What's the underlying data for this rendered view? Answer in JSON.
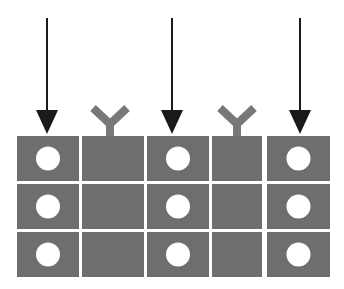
{
  "figure": {
    "title": "",
    "background_color": "#ffffff",
    "cell_fill_color": "#6e6e6e",
    "dot_fill_color": "#ffffff",
    "arrow_color": "#1a1a1a",
    "fork_color": "#787878"
  },
  "grid": {
    "columns": 5,
    "rows": 3,
    "column_x": [
      17,
      82,
      147,
      212,
      267
    ],
    "column_width": [
      62,
      62,
      62,
      50,
      63
    ],
    "row_y": [
      136,
      184,
      232
    ],
    "row_height": 45,
    "dot_radius": 12
  },
  "columns": [
    {
      "index": 1,
      "name": "column-1",
      "marker": "arrow",
      "marker_name": "down-arrow-icon",
      "marker_x": 47,
      "has_dots": true,
      "cells": [
        {
          "row": 1,
          "name": "cell-r1c1",
          "filled": true
        },
        {
          "row": 2,
          "name": "cell-r2c1",
          "filled": true
        },
        {
          "row": 3,
          "name": "cell-r3c1",
          "filled": true
        }
      ]
    },
    {
      "index": 2,
      "name": "column-2",
      "marker": "fork",
      "marker_name": "y-fork-icon",
      "marker_x": 110,
      "has_dots": false,
      "cells": [
        {
          "row": 1,
          "name": "cell-r1c2",
          "filled": false
        },
        {
          "row": 2,
          "name": "cell-r2c2",
          "filled": false
        },
        {
          "row": 3,
          "name": "cell-r3c2",
          "filled": false
        }
      ]
    },
    {
      "index": 3,
      "name": "column-3",
      "marker": "arrow",
      "marker_name": "down-arrow-icon",
      "marker_x": 172,
      "has_dots": true,
      "cells": [
        {
          "row": 1,
          "name": "cell-r1c3",
          "filled": true
        },
        {
          "row": 2,
          "name": "cell-r2c3",
          "filled": true
        },
        {
          "row": 3,
          "name": "cell-r3c3",
          "filled": true
        }
      ]
    },
    {
      "index": 4,
      "name": "column-4",
      "marker": "fork",
      "marker_name": "y-fork-icon",
      "marker_x": 237,
      "has_dots": false,
      "cells": [
        {
          "row": 1,
          "name": "cell-r1c4",
          "filled": false
        },
        {
          "row": 2,
          "name": "cell-r2c4",
          "filled": false
        },
        {
          "row": 3,
          "name": "cell-r3c4",
          "filled": false
        }
      ]
    },
    {
      "index": 5,
      "name": "column-5",
      "marker": "arrow",
      "marker_name": "down-arrow-icon",
      "marker_x": 300,
      "has_dots": true,
      "cells": [
        {
          "row": 1,
          "name": "cell-r1c5",
          "filled": true
        },
        {
          "row": 2,
          "name": "cell-r2c5",
          "filled": true
        },
        {
          "row": 3,
          "name": "cell-r3c5",
          "filled": true
        }
      ]
    }
  ],
  "arrow_geometry": {
    "shaft_top_y": 18,
    "shaft_width": 2,
    "head_top_y": 110,
    "head_tip_y": 134,
    "head_half_width": 11
  },
  "fork_geometry": {
    "arm_top_y": 108,
    "junction_y": 124,
    "stem_bottom_y": 139,
    "arm_half_spread": 17,
    "stroke_width": 8
  }
}
